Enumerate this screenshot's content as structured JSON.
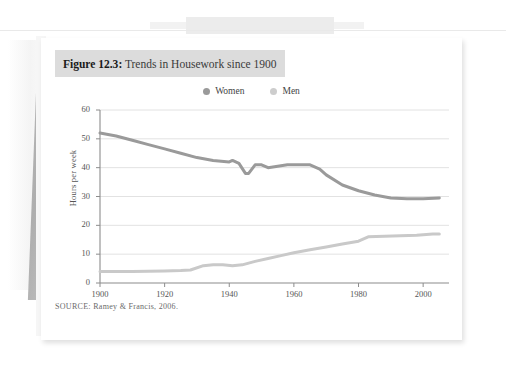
{
  "figure": {
    "label": "Figure 12.3",
    "separator": ":",
    "title": " Trends in Housework since 1900",
    "source": "SOURCE: Ramey & Francis, 2006."
  },
  "colors": {
    "women_line": "#9a9a9a",
    "men_line": "#c9c9c9",
    "grid": "#e2e2e2",
    "axis": "#8c8c8c",
    "title_band": "#dcdcdc",
    "card": "#ffffff"
  },
  "chart_data": {
    "type": "line",
    "title": "Trends in Housework since 1900",
    "xlabel": "",
    "ylabel": "Hours per week",
    "xlim": [
      1900,
      2008
    ],
    "ylim": [
      0,
      60
    ],
    "ytick_step": 10,
    "yticks": [
      0,
      10,
      20,
      30,
      40,
      50,
      60
    ],
    "xticks": [
      1900,
      1920,
      1940,
      1960,
      1980,
      2000
    ],
    "grid": "horizontal",
    "legend_position": "top-center",
    "series": [
      {
        "name": "Women",
        "color": "#9a9a9a",
        "x": [
          1900,
          1905,
          1910,
          1915,
          1920,
          1925,
          1930,
          1935,
          1940,
          1941,
          1943,
          1945,
          1946,
          1948,
          1950,
          1952,
          1955,
          1958,
          1960,
          1963,
          1965,
          1968,
          1970,
          1975,
          1980,
          1985,
          1990,
          1995,
          2000,
          2005
        ],
        "values": [
          52,
          51,
          49.5,
          48,
          46.5,
          45,
          43.5,
          42.5,
          42,
          42.5,
          41.5,
          38,
          38,
          41,
          41,
          40,
          40.5,
          41,
          41,
          41,
          41,
          39.5,
          37.5,
          34,
          32,
          30.5,
          29.5,
          29.2,
          29.2,
          29.5
        ]
      },
      {
        "name": "Men",
        "color": "#c9c9c9",
        "x": [
          1900,
          1910,
          1920,
          1925,
          1928,
          1932,
          1935,
          1938,
          1941,
          1944,
          1948,
          1952,
          1956,
          1960,
          1965,
          1970,
          1975,
          1980,
          1983,
          1988,
          1993,
          1998,
          2003,
          2005
        ],
        "values": [
          4,
          4,
          4.2,
          4.3,
          4.5,
          6,
          6.3,
          6.3,
          6,
          6.3,
          7.5,
          8.5,
          9.5,
          10.5,
          11.5,
          12.5,
          13.5,
          14.5,
          16,
          16.2,
          16.4,
          16.6,
          17,
          17
        ]
      }
    ],
    "legend": [
      {
        "label": "Women",
        "color": "#9a9a9a"
      },
      {
        "label": "Men",
        "color": "#c9c9c9"
      }
    ]
  }
}
